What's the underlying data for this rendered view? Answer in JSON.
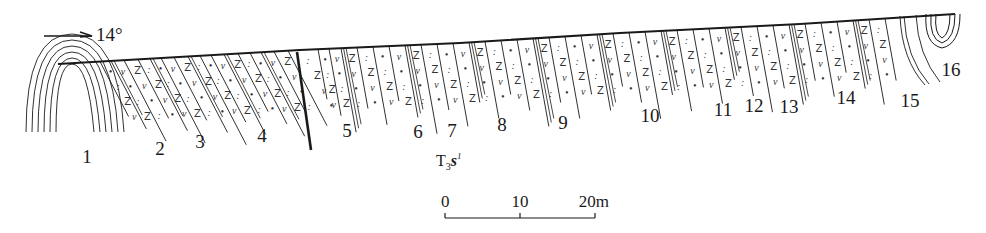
{
  "figure": {
    "type": "geological-cross-section",
    "orientation_arrow": {
      "label": "14°",
      "x1": 44,
      "x2": 92,
      "y": 36
    },
    "surface_line": [
      [
        58,
        64
      ],
      [
        300,
        50
      ],
      [
        460,
        43
      ],
      [
        620,
        33
      ],
      [
        800,
        24
      ],
      [
        955,
        14
      ]
    ],
    "fault_line": {
      "x1": 297,
      "y1": 52,
      "x2": 311,
      "y2": 150
    },
    "formation_label": {
      "main": "T",
      "sub": "3",
      "italic": "s",
      "sup": "1",
      "x": 436,
      "y": 166
    },
    "scale_bar": {
      "ticks": [
        {
          "label": "0",
          "x": 445
        },
        {
          "label": "10",
          "x": 520
        },
        {
          "label": "20m",
          "x": 595
        }
      ],
      "y": 218,
      "label_y": 207
    },
    "layer_labels": [
      {
        "id": "1",
        "x": 87,
        "y": 163
      },
      {
        "id": "2",
        "x": 160,
        "y": 155
      },
      {
        "id": "3",
        "x": 200,
        "y": 148
      },
      {
        "id": "4",
        "x": 262,
        "y": 142
      },
      {
        "id": "5",
        "x": 347,
        "y": 137
      },
      {
        "id": "6",
        "x": 418,
        "y": 138
      },
      {
        "id": "7",
        "x": 452,
        "y": 137
      },
      {
        "id": "8",
        "x": 502,
        "y": 131
      },
      {
        "id": "9",
        "x": 563,
        "y": 129
      },
      {
        "id": "10",
        "x": 650,
        "y": 122
      },
      {
        "id": "11",
        "x": 723,
        "y": 116
      },
      {
        "id": "12",
        "x": 754,
        "y": 112
      },
      {
        "id": "13",
        "x": 789,
        "y": 113
      },
      {
        "id": "14",
        "x": 846,
        "y": 104
      },
      {
        "id": "15",
        "x": 910,
        "y": 107
      },
      {
        "id": "16",
        "x": 951,
        "y": 76
      }
    ],
    "lithology_symbols": {
      "dot": "•",
      "double_dot": ":",
      "z": "Z",
      "v": "ν"
    },
    "colors": {
      "ink": "#1a1a1a",
      "background": "#ffffff"
    }
  }
}
